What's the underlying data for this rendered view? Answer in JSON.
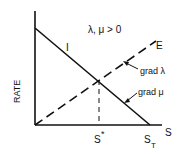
{
  "diagram": {
    "condition_label": "λ, μ > 0",
    "y_axis_label": "RATE",
    "x_axis_label": "S",
    "curves": [
      {
        "name": "I",
        "label": "I",
        "style": "solid",
        "description": "decreasing line from y-axis to S_T"
      },
      {
        "name": "E",
        "label": "E",
        "style": "dashed",
        "description": "increasing line from origin"
      }
    ],
    "annotations": [
      {
        "label": "grad λ",
        "points_to": "E"
      },
      {
        "label": "grad μ",
        "points_to": "I"
      }
    ],
    "x_markers": [
      {
        "label": "S",
        "superscript": "*",
        "description": "equilibrium where I = E"
      },
      {
        "label": "S",
        "subscript": "T",
        "description": "I reaches zero"
      }
    ],
    "colors": {
      "ink": "#111111",
      "background": "#ffffff"
    }
  }
}
